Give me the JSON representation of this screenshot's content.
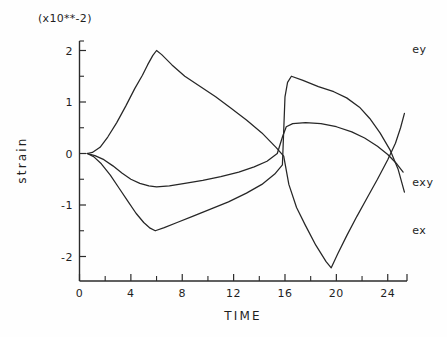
{
  "chart_data": {
    "type": "line",
    "title": "",
    "unit_annotation": "(x10**-2)",
    "xlabel": "TIME",
    "ylabel": "strain",
    "xlim": [
      0,
      25.5
    ],
    "ylim": [
      -2.45,
      2.45
    ],
    "xticks": [
      0,
      4,
      8,
      12,
      16,
      20,
      24
    ],
    "xtick_labels": [
      "0",
      "4",
      "8",
      "12",
      "16",
      "20",
      "24"
    ],
    "x_minor_ticks": [
      2,
      6,
      10,
      14,
      18,
      22
    ],
    "yticks": [
      -2,
      -1,
      0,
      1,
      2
    ],
    "ytick_labels": [
      "-2",
      "-1",
      "0",
      "1",
      "2"
    ],
    "y_minor_ticks": [
      -1.5,
      -0.5,
      0.5,
      1.5
    ],
    "grid": false,
    "legend_position": "right-inline",
    "series": [
      {
        "name": "ey",
        "label": "ey",
        "label_x": 25.9,
        "label_y": 2.02,
        "points": [
          [
            0.6,
            0.0
          ],
          [
            1.0,
            0.02
          ],
          [
            1.6,
            0.12
          ],
          [
            2.2,
            0.32
          ],
          [
            2.9,
            0.6
          ],
          [
            3.6,
            0.92
          ],
          [
            4.3,
            1.26
          ],
          [
            4.9,
            1.52
          ],
          [
            5.3,
            1.72
          ],
          [
            5.7,
            1.9
          ],
          [
            6.0,
            2.0
          ],
          [
            6.4,
            1.92
          ],
          [
            7.2,
            1.72
          ],
          [
            8.2,
            1.5
          ],
          [
            9.4,
            1.3
          ],
          [
            10.6,
            1.1
          ],
          [
            11.8,
            0.88
          ],
          [
            13.0,
            0.65
          ],
          [
            14.2,
            0.4
          ],
          [
            15.3,
            0.12
          ],
          [
            15.9,
            -0.05
          ],
          [
            16.3,
            -0.6
          ],
          [
            16.9,
            -1.05
          ],
          [
            17.6,
            -1.4
          ],
          [
            18.4,
            -1.78
          ],
          [
            19.2,
            -2.1
          ],
          [
            19.6,
            -2.22
          ],
          [
            20.1,
            -1.95
          ],
          [
            20.8,
            -1.6
          ],
          [
            21.6,
            -1.22
          ],
          [
            22.4,
            -0.86
          ],
          [
            23.2,
            -0.5
          ],
          [
            24.0,
            -0.12
          ],
          [
            24.6,
            0.2
          ],
          [
            25.0,
            0.5
          ],
          [
            25.3,
            0.78
          ]
        ]
      },
      {
        "name": "exy",
        "label": "exy",
        "label_x": 25.9,
        "label_y": -0.55,
        "points": [
          [
            0.6,
            0.0
          ],
          [
            1.2,
            -0.04
          ],
          [
            1.9,
            -0.12
          ],
          [
            2.6,
            -0.24
          ],
          [
            3.3,
            -0.38
          ],
          [
            4.0,
            -0.5
          ],
          [
            4.7,
            -0.58
          ],
          [
            5.4,
            -0.63
          ],
          [
            6.0,
            -0.65
          ],
          [
            7.0,
            -0.63
          ],
          [
            8.2,
            -0.58
          ],
          [
            9.6,
            -0.52
          ],
          [
            11.0,
            -0.45
          ],
          [
            12.4,
            -0.36
          ],
          [
            13.6,
            -0.26
          ],
          [
            14.6,
            -0.15
          ],
          [
            15.4,
            0.0
          ],
          [
            15.8,
            0.32
          ],
          [
            16.1,
            0.52
          ],
          [
            16.6,
            0.58
          ],
          [
            17.6,
            0.6
          ],
          [
            18.8,
            0.58
          ],
          [
            20.0,
            0.52
          ],
          [
            21.2,
            0.42
          ],
          [
            22.2,
            0.3
          ],
          [
            23.2,
            0.14
          ],
          [
            24.0,
            -0.02
          ],
          [
            24.7,
            -0.2
          ],
          [
            25.2,
            -0.36
          ]
        ]
      },
      {
        "name": "ex",
        "label": "ex",
        "label_x": 25.9,
        "label_y": -1.48,
        "points": [
          [
            0.6,
            0.0
          ],
          [
            1.1,
            -0.06
          ],
          [
            1.7,
            -0.2
          ],
          [
            2.4,
            -0.42
          ],
          [
            3.1,
            -0.68
          ],
          [
            3.8,
            -0.94
          ],
          [
            4.4,
            -1.16
          ],
          [
            5.0,
            -1.34
          ],
          [
            5.5,
            -1.45
          ],
          [
            5.9,
            -1.5
          ],
          [
            6.6,
            -1.44
          ],
          [
            7.6,
            -1.34
          ],
          [
            8.8,
            -1.22
          ],
          [
            10.2,
            -1.08
          ],
          [
            11.6,
            -0.94
          ],
          [
            13.0,
            -0.77
          ],
          [
            14.2,
            -0.6
          ],
          [
            15.2,
            -0.4
          ],
          [
            15.8,
            -0.22
          ],
          [
            16.0,
            1.1
          ],
          [
            16.2,
            1.38
          ],
          [
            16.5,
            1.5
          ],
          [
            17.4,
            1.42
          ],
          [
            18.6,
            1.3
          ],
          [
            19.8,
            1.2
          ],
          [
            20.8,
            1.08
          ],
          [
            21.8,
            0.9
          ],
          [
            22.6,
            0.68
          ],
          [
            23.4,
            0.4
          ],
          [
            24.2,
            0.06
          ],
          [
            24.8,
            -0.3
          ],
          [
            25.3,
            -0.75
          ]
        ]
      }
    ]
  },
  "figure": {
    "unit_annotation": "(x10**-2)",
    "y_axis_title": "strain",
    "x_axis_title": "TIME"
  }
}
